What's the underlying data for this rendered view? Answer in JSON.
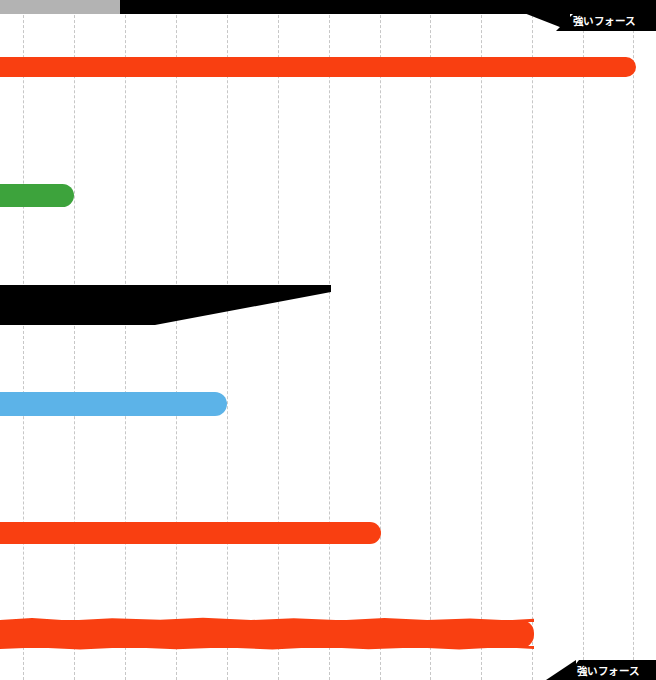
{
  "canvas": {
    "width": 656,
    "height": 680,
    "background": "#ffffff"
  },
  "header": {
    "gray_band_color": "#b3b3b3",
    "black_band_color": "#000000"
  },
  "labels": {
    "top_right_tab": "強いフォース",
    "bottom_right_tab": "強いフォース"
  },
  "grid": {
    "orientation": "vertical",
    "style": "dashed",
    "color": "#9a9a9a",
    "spacing_px": 51,
    "positions": [
      23,
      74,
      125,
      176,
      227,
      278,
      329,
      380,
      430,
      481,
      532,
      583,
      633
    ]
  },
  "chart_data": {
    "type": "bar",
    "title": "強いフォース",
    "xlabel": "",
    "ylabel": "",
    "orientation": "horizontal",
    "xlim": [
      0,
      656
    ],
    "grid": true,
    "legend": "none",
    "categories": [
      "bar-1",
      "bar-2",
      "bar-3",
      "bar-4",
      "bar-5",
      "bar-6"
    ],
    "values": [
      636,
      74,
      331,
      227,
      381,
      534
    ],
    "series": [
      {
        "name": "強いフォース",
        "values": [
          636,
          74,
          331,
          227,
          381,
          534
        ]
      }
    ],
    "bars": [
      {
        "id": "bar-orange-1",
        "color": "#f93f11",
        "color_name": "orange-red",
        "x": 0,
        "y": 57,
        "length": 636,
        "thickness": 20,
        "shape": "rounded-right-cap"
      },
      {
        "id": "bar-green-1",
        "color": "#3da33c",
        "color_name": "green",
        "x": 0,
        "y": 184,
        "length": 74,
        "thickness": 23,
        "shape": "rounded-right-cap"
      },
      {
        "id": "wedge-black-1",
        "color": "#000000",
        "color_name": "black",
        "x": 0,
        "y": 283,
        "length": 331,
        "thickness": 42,
        "shape": "tapered-wedge"
      },
      {
        "id": "bar-blue-1",
        "color": "#5cb3e8",
        "color_name": "light-blue",
        "x": 0,
        "y": 392,
        "length": 227,
        "thickness": 24,
        "shape": "rounded-right-cap"
      },
      {
        "id": "bar-orange-2",
        "color": "#f93f11",
        "color_name": "orange-red",
        "x": 0,
        "y": 522,
        "length": 381,
        "thickness": 22,
        "shape": "rounded-right-cap"
      },
      {
        "id": "bar-orange-3",
        "color": "#f93f11",
        "color_name": "orange-red",
        "x": 0,
        "y": 620,
        "length": 534,
        "thickness": 28,
        "shape": "rough-hand-drawn"
      }
    ]
  }
}
